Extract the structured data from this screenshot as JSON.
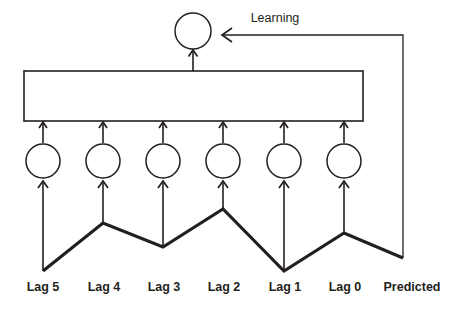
{
  "diagram": {
    "colors": {
      "stroke": "#231f20",
      "background": "#ffffff"
    },
    "output_node": {
      "name": "output-neuron",
      "label": "",
      "cx": 193,
      "cy": 31,
      "r": 18
    },
    "hidden_layer_box": {
      "name": "hidden-layer-box",
      "label": "",
      "x": 24,
      "y": 71,
      "width": 339,
      "height": 50
    },
    "feedback": {
      "label": "Learning",
      "label_x": 275,
      "label_y": 22,
      "line_y": 35,
      "arrow_tip_x": 222,
      "right_x": 403,
      "bottom_y": 258
    },
    "input_nodes": [
      {
        "label": "Lag 5",
        "cx": 43,
        "cy": 161,
        "r": 17
      },
      {
        "label": "Lag 4",
        "cx": 103,
        "cy": 161,
        "r": 17
      },
      {
        "label": "Lag 3",
        "cx": 163,
        "cy": 161,
        "r": 17
      },
      {
        "label": "Lag 2",
        "cx": 223,
        "cy": 161,
        "r": 17
      },
      {
        "label": "Lag 1",
        "cx": 284,
        "cy": 161,
        "r": 17
      },
      {
        "label": "Lag 0",
        "cx": 344,
        "cy": 161,
        "r": 17
      }
    ],
    "axis_labels": [
      {
        "text": "Lag 5",
        "x": 43,
        "y": 291
      },
      {
        "text": "Lag 4",
        "x": 104,
        "y": 291
      },
      {
        "text": "Lag 3",
        "x": 164,
        "y": 291
      },
      {
        "text": "Lag 2",
        "x": 224,
        "y": 291
      },
      {
        "text": "Lag 1",
        "x": 285,
        "y": 291
      },
      {
        "text": "Lag 0",
        "x": 345,
        "y": 291
      },
      {
        "text": "Predicted",
        "x": 412,
        "y": 291
      }
    ],
    "series_points": [
      {
        "x": 43,
        "y": 271
      },
      {
        "x": 103,
        "y": 223
      },
      {
        "x": 163,
        "y": 247
      },
      {
        "x": 223,
        "y": 209
      },
      {
        "x": 284,
        "y": 271
      },
      {
        "x": 344,
        "y": 233
      },
      {
        "x": 403,
        "y": 258
      }
    ],
    "series_arrows": [
      {
        "from_x": 43,
        "from_y": 271,
        "to_y": 182
      },
      {
        "from_x": 103,
        "from_y": 223,
        "to_y": 182
      },
      {
        "from_x": 163,
        "from_y": 247,
        "to_y": 182
      },
      {
        "from_x": 223,
        "from_y": 209,
        "to_y": 182
      },
      {
        "from_x": 284,
        "from_y": 271,
        "to_y": 182
      },
      {
        "from_x": 344,
        "from_y": 233,
        "to_y": 182
      }
    ],
    "node_to_box_arrows": [
      {
        "x": 43,
        "from_y": 143,
        "to_y": 123
      },
      {
        "x": 103,
        "from_y": 143,
        "to_y": 123
      },
      {
        "x": 163,
        "from_y": 143,
        "to_y": 123
      },
      {
        "x": 223,
        "from_y": 143,
        "to_y": 123
      },
      {
        "x": 284,
        "from_y": 143,
        "to_y": 123
      },
      {
        "x": 344,
        "from_y": 143,
        "to_y": 123
      }
    ],
    "box_to_output_arrow": {
      "x": 193,
      "from_y": 71,
      "to_y": 51
    }
  },
  "chart_data": {
    "type": "line",
    "title": "",
    "xlabel": "",
    "ylabel": "",
    "categories": [
      "Lag 5",
      "Lag 4",
      "Lag 3",
      "Lag 2",
      "Lag 1",
      "Lag 0",
      "Predicted"
    ],
    "values": [
      1,
      5,
      3,
      6,
      1,
      4,
      2
    ],
    "annotations": [
      "Learning"
    ],
    "grid": false,
    "legend": "none"
  }
}
